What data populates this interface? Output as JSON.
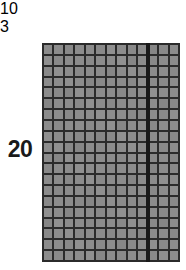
{
  "diagram": {
    "kind": "area-model-grid",
    "row_label": "20",
    "column_labels": [
      "10",
      "3"
    ],
    "grid_fill_color": "#8c8c8c",
    "grid_line_color": "#2b2b2b",
    "partition_color": "#191919",
    "text_color": "#1a1a1a",
    "background_color": "#ffffff"
  },
  "chart_data": {
    "type": "heatmap",
    "title": "",
    "xlabel": "",
    "ylabel": "",
    "rows": 20,
    "columns": 13,
    "column_groups": [
      {
        "label": "10",
        "columns": 10
      },
      {
        "label": "3",
        "columns": 3
      }
    ],
    "row_groups": [
      {
        "label": "20",
        "rows": 20
      }
    ],
    "total_cells": 260,
    "grid": true,
    "legend": "none"
  }
}
